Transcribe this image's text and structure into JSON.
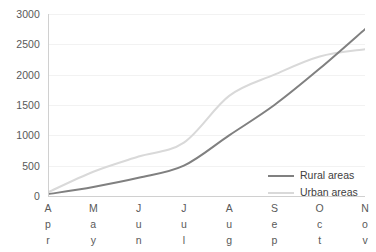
{
  "chart_data": {
    "type": "line",
    "title": "",
    "subtitle": "",
    "xlabel": "",
    "ylabel": "",
    "categories": [
      "Apr",
      "May",
      "Jun",
      "Jul",
      "Aug",
      "Sep",
      "Oct",
      "Nov"
    ],
    "ylim": [
      0,
      3000
    ],
    "yticks": [
      0,
      500,
      1000,
      1500,
      2000,
      2500,
      3000
    ],
    "ytick_labels": [
      "0",
      "500",
      "1000",
      "1500",
      "2000",
      "2500",
      "3000"
    ],
    "grid": true,
    "grid_axis": "y",
    "legend_position": "inside-bottom-right",
    "smooth": true,
    "series": [
      {
        "name": "Rural areas",
        "color": "#808080",
        "line_width": 2,
        "values": [
          30,
          150,
          300,
          500,
          1000,
          1500,
          2100,
          2750
        ]
      },
      {
        "name": "Urban areas",
        "color": "#d9d9d9",
        "line_width": 2,
        "values": [
          60,
          400,
          650,
          880,
          1650,
          2000,
          2300,
          2420
        ]
      }
    ],
    "annotations": [],
    "colors": {
      "background": "#ffffff",
      "gridline": "#f2f2f2",
      "axis": "#d0d0d0",
      "tick_text": "#595959",
      "legend_text": "#404040"
    }
  },
  "legend": {
    "items": [
      {
        "label": "Rural areas"
      },
      {
        "label": "Urban areas"
      }
    ]
  },
  "x_axis": {
    "ticks": [
      {
        "label": "Apr",
        "chars": [
          "A",
          "p",
          "r"
        ]
      },
      {
        "label": "May",
        "chars": [
          "M",
          "a",
          "y"
        ]
      },
      {
        "label": "Jun",
        "chars": [
          "J",
          "u",
          "n"
        ]
      },
      {
        "label": "Jul",
        "chars": [
          "J",
          "u",
          "l"
        ]
      },
      {
        "label": "Aug",
        "chars": [
          "A",
          "u",
          "g"
        ]
      },
      {
        "label": "Sep",
        "chars": [
          "S",
          "e",
          "p"
        ]
      },
      {
        "label": "Oct",
        "chars": [
          "O",
          "c",
          "t"
        ]
      },
      {
        "label": "Nov",
        "chars": [
          "N",
          "o",
          "v"
        ]
      }
    ]
  },
  "y_axis": {
    "ticks": [
      "3000",
      "2500",
      "2000",
      "1500",
      "1000",
      "500",
      "0"
    ]
  }
}
